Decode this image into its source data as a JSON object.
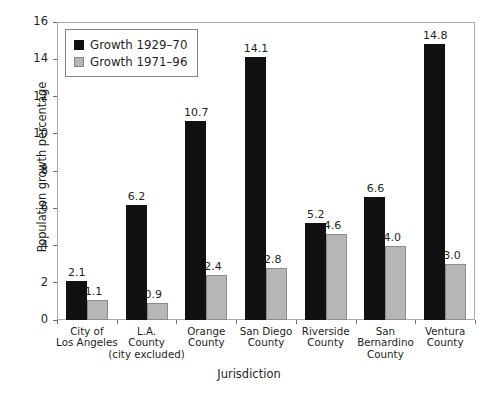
{
  "chart_data": {
    "type": "bar",
    "title": "",
    "xlabel": "Jurisdiction",
    "ylabel": "Population growth percentage",
    "ylim": [
      0,
      16
    ],
    "yticks": [
      0,
      2,
      4,
      6,
      8,
      10,
      12,
      14,
      16
    ],
    "grid": false,
    "legend_position": "top-left",
    "categories": [
      "City of\nLos Angeles",
      "L.A.\nCounty\n(city excluded)",
      "Orange\nCounty",
      "San Diego\nCounty",
      "Riverside\nCounty",
      "San\nBernardino\nCounty",
      "Ventura\nCounty"
    ],
    "category_lines": [
      [
        "City of",
        "Los Angeles"
      ],
      [
        "L.A.",
        "County",
        "(city excluded)"
      ],
      [
        "Orange",
        "County"
      ],
      [
        "San Diego",
        "County"
      ],
      [
        "Riverside",
        "County"
      ],
      [
        "San",
        "Bernardino",
        "County"
      ],
      [
        "Ventura",
        "County"
      ]
    ],
    "series": [
      {
        "name": "Growth 1929–70",
        "color": "#111111",
        "values": [
          2.1,
          6.2,
          10.7,
          14.1,
          5.2,
          6.6,
          14.8
        ],
        "labels": [
          "2.1",
          "6.2",
          "10.7",
          "14.1",
          "5.2",
          "6.6",
          "14.8"
        ]
      },
      {
        "name": "Growth 1971–96",
        "color": "#b6b6b6",
        "values": [
          1.1,
          0.9,
          2.4,
          2.8,
          4.6,
          4.0,
          3.0
        ],
        "labels": [
          "1.1",
          "0.9",
          "2.4",
          "2.8",
          "4.6",
          "4.0",
          "3.0"
        ]
      }
    ]
  },
  "legend": {
    "items": [
      {
        "label": "Growth 1929–70",
        "swatch": "dark"
      },
      {
        "label": "Growth 1971–96",
        "swatch": "light"
      }
    ]
  },
  "caption": {
    "text": ""
  }
}
